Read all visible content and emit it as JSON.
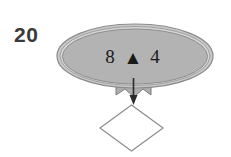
{
  "figure": {
    "number_label": "20",
    "ellipse_node": {
      "icon": "filled-triangle-glyph",
      "left_value": "8",
      "center_symbol": "▲",
      "right_value": "4",
      "full_text": "8 ▲ 4",
      "fill_color": "#b3b3b3",
      "stroke_color": "#8a8a8a",
      "highlight_color": "#d6d6d6"
    },
    "ribbon": {
      "name": "banner-ribbon",
      "fill_color": "#adadad",
      "stroke_color": "#7d7d7d"
    },
    "arrow": {
      "name": "down-arrow",
      "direction": "down",
      "color": "#2b2b2b"
    },
    "diamond_node": {
      "name": "decision-diamond",
      "label": "",
      "fill_color": "#ffffff",
      "stroke_color": "#8c8c8c"
    },
    "background_color": "#ffffff"
  }
}
